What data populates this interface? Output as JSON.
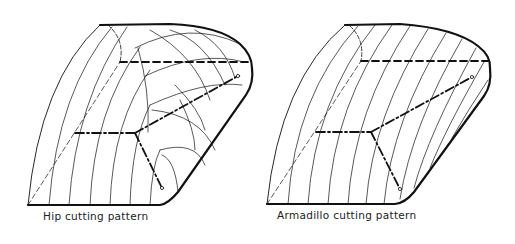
{
  "figures": [
    {
      "id": "hip",
      "caption": "Hip cutting pattern"
    },
    {
      "id": "armadillo",
      "caption": "Armadillo cutting pattern"
    }
  ],
  "colors": {
    "ink": "#111111",
    "background": "#ffffff"
  }
}
